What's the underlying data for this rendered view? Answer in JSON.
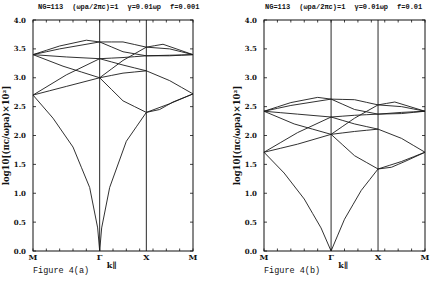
{
  "panels": [
    {
      "id": "a",
      "header": {
        "ng": "NG=113",
        "param1": "(ωpa/2πc)=1",
        "param2": "γ=0.01ωp",
        "param3": "f=0.001"
      },
      "caption": "Figure 4(a)"
    },
    {
      "id": "b",
      "header": {
        "ng": "NG=113",
        "param1": "(ωpa/2πc)=1",
        "param2": "γ=0.01ωp",
        "param3": "f=0.01"
      },
      "caption": "Figure 4(b)"
    }
  ],
  "chart_data": [
    {
      "type": "line",
      "title": "NG=113 (ωpa/2πc)=1 γ=0.01ωp f=0.001",
      "caption": "Figure 4(a)",
      "xlabel": "k∥",
      "ylabel": "log10[(πc/ωpa)×10²]",
      "ylim": [
        0.0,
        4.0
      ],
      "yticks": [
        "0.0",
        "0.5",
        "1.0",
        "1.5",
        "2.0",
        "2.5",
        "3.0",
        "3.5",
        "4.0"
      ],
      "x_symmetry_points": [
        "M",
        "Γ",
        "X",
        "M"
      ],
      "x_positions": [
        0,
        1,
        1.7,
        2.4
      ],
      "grid": false,
      "series": [
        {
          "name": "band1",
          "x": [
            0,
            0.3,
            0.6,
            0.85,
            0.97,
            1.0,
            1.03,
            1.15,
            1.4,
            1.7
          ],
          "y": [
            2.7,
            2.3,
            1.8,
            1.1,
            0.4,
            0.0,
            0.4,
            1.1,
            1.9,
            2.4
          ]
        },
        {
          "name": "band1b",
          "x": [
            1.7,
            1.9,
            2.1,
            2.4
          ],
          "y": [
            2.4,
            2.45,
            2.58,
            2.72
          ]
        },
        {
          "name": "band2",
          "x": [
            0,
            0.5,
            1.0
          ],
          "y": [
            2.7,
            2.85,
            3.0
          ]
        },
        {
          "name": "band2b",
          "x": [
            1.0,
            1.35,
            1.7,
            2.05,
            2.4
          ],
          "y": [
            3.0,
            2.6,
            2.4,
            2.55,
            2.72
          ]
        },
        {
          "name": "band3",
          "x": [
            0,
            0.5,
            1.0
          ],
          "y": [
            2.7,
            3.05,
            3.33
          ]
        },
        {
          "name": "band3b",
          "x": [
            1.0,
            1.35,
            1.7
          ],
          "y": [
            3.0,
            3.08,
            3.12
          ]
        },
        {
          "name": "band4",
          "x": [
            0,
            0.45,
            1.0
          ],
          "y": [
            3.4,
            3.2,
            3.0
          ]
        },
        {
          "name": "band4b",
          "x": [
            1.0,
            1.35,
            1.7,
            2.05,
            2.4
          ],
          "y": [
            3.33,
            3.22,
            3.12,
            2.95,
            2.72
          ]
        },
        {
          "name": "band5",
          "x": [
            0,
            0.5,
            1.0
          ],
          "y": [
            3.4,
            3.36,
            3.33
          ]
        },
        {
          "name": "band5b",
          "x": [
            1.0,
            1.35,
            1.7,
            2.05,
            2.4
          ],
          "y": [
            3.33,
            3.35,
            3.38,
            3.39,
            3.4
          ]
        },
        {
          "name": "band6",
          "x": [
            0,
            0.4,
            1.0
          ],
          "y": [
            3.4,
            3.5,
            3.62
          ]
        },
        {
          "name": "band6b",
          "x": [
            1.0,
            1.35,
            1.7,
            2.05,
            2.4
          ],
          "y": [
            3.62,
            3.45,
            3.38,
            3.38,
            3.4
          ]
        },
        {
          "name": "band7",
          "x": [
            0,
            0.4,
            0.8,
            1.0
          ],
          "y": [
            3.4,
            3.55,
            3.65,
            3.62
          ]
        },
        {
          "name": "band7b",
          "x": [
            1.0,
            1.35,
            1.7,
            2.05,
            2.4
          ],
          "y": [
            3.62,
            3.62,
            3.53,
            3.5,
            3.4
          ]
        },
        {
          "name": "band8",
          "x": [
            1.0,
            1.35,
            1.7,
            1.95,
            2.4
          ],
          "y": [
            3.0,
            3.3,
            3.53,
            3.58,
            3.4
          ]
        }
      ]
    },
    {
      "type": "line",
      "title": "NG=113 (ωpa/2πc)=1 γ=0.01ωp f=0.01",
      "caption": "Figure 4(b)",
      "xlabel": "k∥",
      "ylabel": "log10[(πc/ωpa)×10²]",
      "ylim": [
        0.0,
        4.0
      ],
      "yticks": [
        "0.0",
        "0.5",
        "1.0",
        "1.5",
        "2.0",
        "2.5",
        "3.0",
        "3.5",
        "4.0"
      ],
      "x_symmetry_points": [
        "M",
        "Γ",
        "X",
        "M"
      ],
      "x_positions": [
        0,
        1,
        1.7,
        2.4
      ],
      "grid": false,
      "series": [
        {
          "name": "band1",
          "x": [
            0,
            0.3,
            0.6,
            0.85,
            1.0
          ],
          "y": [
            1.71,
            1.35,
            0.9,
            0.4,
            0.0
          ]
        },
        {
          "name": "band1r",
          "x": [
            1.0,
            1.2,
            1.45,
            1.7
          ],
          "y": [
            0.0,
            0.55,
            1.05,
            1.42
          ]
        },
        {
          "name": "band1b",
          "x": [
            1.7,
            1.9,
            2.1,
            2.4
          ],
          "y": [
            1.42,
            1.45,
            1.55,
            1.71
          ]
        },
        {
          "name": "band2",
          "x": [
            0,
            0.5,
            1.0
          ],
          "y": [
            1.71,
            1.85,
            2.02
          ]
        },
        {
          "name": "band2b",
          "x": [
            1.0,
            1.35,
            1.7,
            2.05,
            2.4
          ],
          "y": [
            2.02,
            1.65,
            1.42,
            1.55,
            1.71
          ]
        },
        {
          "name": "band3",
          "x": [
            0,
            0.5,
            1.0
          ],
          "y": [
            1.71,
            2.05,
            2.32
          ]
        },
        {
          "name": "band3b",
          "x": [
            1.0,
            1.35,
            1.7
          ],
          "y": [
            2.02,
            2.07,
            2.11
          ]
        },
        {
          "name": "band4",
          "x": [
            0,
            0.45,
            1.0
          ],
          "y": [
            2.42,
            2.2,
            2.02
          ]
        },
        {
          "name": "band4b",
          "x": [
            1.0,
            1.35,
            1.7,
            2.05,
            2.4
          ],
          "y": [
            2.32,
            2.2,
            2.11,
            1.95,
            1.71
          ]
        },
        {
          "name": "band5",
          "x": [
            0,
            0.5,
            1.0
          ],
          "y": [
            2.42,
            2.37,
            2.32
          ]
        },
        {
          "name": "band5b",
          "x": [
            1.0,
            1.35,
            1.7,
            2.05,
            2.4
          ],
          "y": [
            2.32,
            2.35,
            2.37,
            2.4,
            2.42
          ]
        },
        {
          "name": "band6",
          "x": [
            0,
            0.4,
            1.0
          ],
          "y": [
            2.42,
            2.52,
            2.63
          ]
        },
        {
          "name": "band6b",
          "x": [
            1.0,
            1.35,
            1.7,
            2.05,
            2.4
          ],
          "y": [
            2.63,
            2.45,
            2.37,
            2.38,
            2.42
          ]
        },
        {
          "name": "band7",
          "x": [
            0,
            0.4,
            0.8,
            1.0
          ],
          "y": [
            2.42,
            2.57,
            2.66,
            2.63
          ]
        },
        {
          "name": "band7b",
          "x": [
            1.0,
            1.35,
            1.7,
            2.05,
            2.4
          ],
          "y": [
            2.63,
            2.62,
            2.53,
            2.5,
            2.42
          ]
        },
        {
          "name": "band8",
          "x": [
            1.0,
            1.35,
            1.7,
            1.95,
            2.4
          ],
          "y": [
            2.02,
            2.3,
            2.53,
            2.58,
            2.42
          ]
        }
      ]
    }
  ]
}
